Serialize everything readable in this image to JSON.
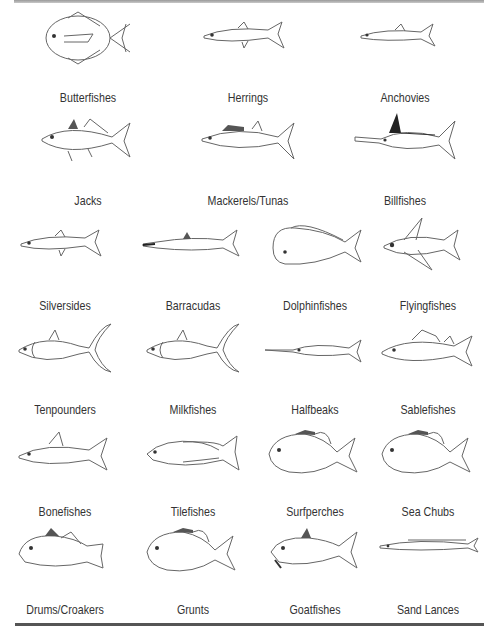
{
  "rows": [
    {
      "columns": 3,
      "fish": [
        {
          "label": "Butterfishes",
          "shape": "round",
          "icon": "butterfish-icon"
        },
        {
          "label": "Herrings",
          "shape": "slender",
          "icon": "herring-icon"
        },
        {
          "label": "Anchovies",
          "shape": "slender-small",
          "icon": "anchovy-icon"
        }
      ]
    },
    {
      "columns": 3,
      "fish": [
        {
          "label": "Jacks",
          "shape": "jack",
          "icon": "jack-icon"
        },
        {
          "label": "Mackerels/Tunas",
          "shape": "mackerel",
          "icon": "mackerel-icon"
        },
        {
          "label": "Billfishes",
          "shape": "billfish",
          "icon": "billfish-icon"
        }
      ]
    },
    {
      "columns": 4,
      "fish": [
        {
          "label": "Silversides",
          "shape": "slender",
          "icon": "silverside-icon"
        },
        {
          "label": "Barracudas",
          "shape": "barracuda",
          "icon": "barracuda-icon"
        },
        {
          "label": "Dolphinfishes",
          "shape": "dolphin",
          "icon": "dolphinfish-icon"
        },
        {
          "label": "Flyingfishes",
          "shape": "flying",
          "icon": "flyingfish-icon"
        }
      ]
    },
    {
      "columns": 4,
      "fish": [
        {
          "label": "Tenpounders",
          "shape": "tenpounder",
          "icon": "tenpounder-icon"
        },
        {
          "label": "Milkfishes",
          "shape": "tenpounder",
          "icon": "milkfish-icon"
        },
        {
          "label": "Halfbeaks",
          "shape": "halfbeak",
          "icon": "halfbeak-icon"
        },
        {
          "label": "Sablefishes",
          "shape": "sable",
          "icon": "sablefish-icon"
        }
      ]
    },
    {
      "columns": 4,
      "fish": [
        {
          "label": "Bonefishes",
          "shape": "bone",
          "icon": "bonefish-icon"
        },
        {
          "label": "Tilefishes",
          "shape": "tile",
          "icon": "tilefish-icon"
        },
        {
          "label": "Surfperches",
          "shape": "perch",
          "icon": "surfperch-icon"
        },
        {
          "label": "Sea Chubs",
          "shape": "perch",
          "icon": "sea-chub-icon"
        }
      ]
    },
    {
      "columns": 4,
      "fish": [
        {
          "label": "Drums/Croakers",
          "shape": "drum",
          "icon": "drum-icon"
        },
        {
          "label": "Grunts",
          "shape": "perch",
          "icon": "grunt-icon"
        },
        {
          "label": "Goatfishes",
          "shape": "goat",
          "icon": "goatfish-icon"
        },
        {
          "label": "Sand Lances",
          "shape": "lance",
          "icon": "sand-lance-icon"
        }
      ]
    }
  ],
  "colors": {
    "line": "#555555",
    "text": "#333333",
    "rule": "#555555"
  }
}
